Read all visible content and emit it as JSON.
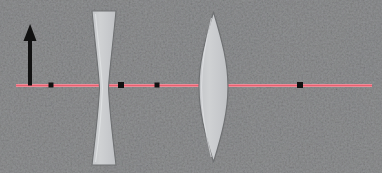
{
  "canvas": {
    "width": 382,
    "height": 173,
    "background_color": "#fbfcfd",
    "texture": "faint mottled bluish-grey paper scan noise"
  },
  "diagram": {
    "type": "optics-ray-diagram"
  },
  "optical_axis": {
    "label": "optical-axis",
    "color": "#f09aa6",
    "highlight_color": "#e8606f",
    "y": 85,
    "x_start": 16,
    "x_end": 372,
    "thickness": 2
  },
  "object_arrow": {
    "label": "object-arrow",
    "color": "#111111",
    "x": 30,
    "base_y": 85,
    "tip_y": 24,
    "shaft_width": 4,
    "head_width": 13,
    "head_height": 17,
    "direction": "up"
  },
  "elements": [
    {
      "name": "biconcave-lens",
      "kind": "diverging lens",
      "fill": "#c9cbcd",
      "stroke": "#6e7072",
      "center_x": 104,
      "top_y": 11,
      "bottom_y": 165,
      "edge_half_width": 12,
      "waist_half_width": 4.5
    },
    {
      "name": "biconvex-lens",
      "kind": "converging lens",
      "fill": "#c9cbcd",
      "stroke": "#6e7072",
      "center_x": 213.5,
      "top_y": 12,
      "bottom_y": 162,
      "center_half_width": 14.5
    }
  ],
  "axis_points": [
    {
      "name": "point-object-focus",
      "x": 51,
      "y": 85,
      "size": 5,
      "color": "#111111"
    },
    {
      "name": "point-concave-right-focus",
      "x": 121,
      "y": 85,
      "size": 6,
      "color": "#111111"
    },
    {
      "name": "point-intermediate-image",
      "x": 157,
      "y": 85,
      "size": 5,
      "color": "#111111"
    },
    {
      "name": "point-final-image",
      "x": 300,
      "y": 85,
      "size": 6,
      "color": "#111111"
    }
  ],
  "chart_data": {
    "type": "scatter",
    "xlabel": "optical axis (px)",
    "ylabel": "",
    "xlim": [
      0,
      382
    ],
    "ylim": [
      0,
      173
    ],
    "grid": false,
    "legend": "none",
    "series": [
      {
        "name": "axis point markers",
        "x": [
          51,
          121,
          157,
          300
        ],
        "y": [
          85,
          85,
          85,
          85
        ]
      }
    ],
    "annotations": [
      "object arrow at x=30 rising from axis to y=24",
      "biconcave (diverging) lens centered at x=104",
      "biconvex (converging) lens centered at x=213.5",
      "optical axis drawn in pink from x=16 to x=372 at y=85"
    ]
  }
}
